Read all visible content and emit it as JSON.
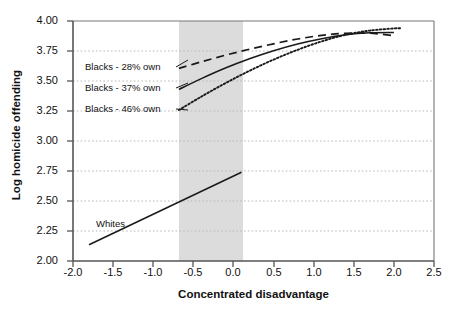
{
  "chart_data": {
    "type": "line",
    "title": "",
    "xlabel": "Concentrated disadvantage",
    "ylabel": "Log homicide offending",
    "xlim": [
      -2.0,
      2.5
    ],
    "ylim": [
      2.0,
      4.0
    ],
    "xticks": [
      "-2.0",
      "-1.5",
      "-1.0",
      "-0.5",
      "0.0",
      "0.5",
      "1.0",
      "1.5",
      "2.0",
      "2.5"
    ],
    "xtick_values": [
      -2.0,
      -1.5,
      -1.0,
      -0.5,
      0.0,
      0.5,
      1.0,
      1.5,
      2.0,
      2.5
    ],
    "yticks": [
      "2.00",
      "2.25",
      "2.50",
      "2.75",
      "3.00",
      "3.25",
      "3.50",
      "3.75",
      "4.00"
    ],
    "ytick_values": [
      2.0,
      2.25,
      2.5,
      2.75,
      3.0,
      3.25,
      3.5,
      3.75,
      4.0
    ],
    "grid": "horizontal-dotted",
    "legend_position": "inline-annotations",
    "shaded_band": {
      "x_start": -0.68,
      "x_end": 0.12,
      "color": "#dcdcdc",
      "label": ""
    },
    "series": [
      {
        "name": "Blacks - 28% own",
        "style": "dashed",
        "color": "#1a1a1a",
        "x": [
          -0.68,
          -0.4,
          -0.1,
          0.2,
          0.5,
          0.8,
          1.1,
          1.4,
          1.7,
          2.0
        ],
        "y": [
          3.605,
          3.66,
          3.715,
          3.765,
          3.81,
          3.85,
          3.88,
          3.898,
          3.898,
          3.878
        ]
      },
      {
        "name": "Blacks - 37% own",
        "style": "solid",
        "color": "#1a1a1a",
        "x": [
          -0.68,
          -0.4,
          -0.1,
          0.2,
          0.5,
          0.8,
          1.1,
          1.4,
          1.7,
          2.0
        ],
        "y": [
          3.43,
          3.52,
          3.608,
          3.685,
          3.752,
          3.808,
          3.852,
          3.885,
          3.902,
          3.905
        ]
      },
      {
        "name": "Blacks - 46% own",
        "style": "dotted",
        "color": "#1a1a1a",
        "x": [
          -0.68,
          -0.4,
          -0.1,
          0.2,
          0.5,
          0.8,
          1.1,
          1.4,
          1.7,
          2.0,
          2.1
        ],
        "y": [
          3.258,
          3.37,
          3.482,
          3.585,
          3.678,
          3.76,
          3.83,
          3.885,
          3.92,
          3.938,
          3.94
        ]
      },
      {
        "name": "Whites",
        "style": "solid",
        "color": "#1a1a1a",
        "x": [
          -1.8,
          0.1
        ],
        "y": [
          2.135,
          2.74
        ]
      }
    ],
    "annotations": [
      {
        "text": "Blacks - 28% own",
        "x": -1.54,
        "y": 3.565
      },
      {
        "text": "Blacks - 37% own",
        "x": -1.54,
        "y": 3.39
      },
      {
        "text": "Blacks - 46% own",
        "x": -1.54,
        "y": 3.218
      },
      {
        "text": "Whites",
        "x": -1.4,
        "y": 2.345
      }
    ]
  },
  "colors": {
    "axis": "#555555",
    "line": "#1a1a1a",
    "grid": "#bbbbbb",
    "band": "#dcdcdc",
    "text": "#111111",
    "background": "#ffffff"
  }
}
